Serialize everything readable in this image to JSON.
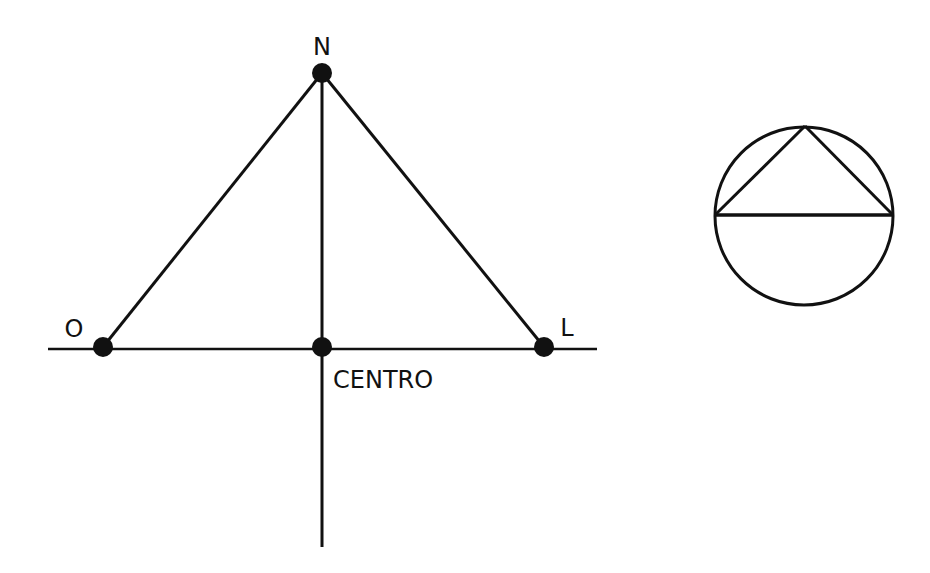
{
  "diagram": {
    "labels": {
      "north": "N",
      "west": "O",
      "east": "L",
      "center": "CENTRO"
    },
    "colors": {
      "stroke": "#111111",
      "background": "#ffffff"
    },
    "points": {
      "north": [
        322,
        73
      ],
      "west": [
        103,
        347
      ],
      "east": [
        544,
        347
      ],
      "center": [
        322,
        347
      ]
    },
    "inset": {
      "shape": "circle with inscribed triangle",
      "center": [
        804,
        216
      ],
      "radius": 89
    }
  }
}
